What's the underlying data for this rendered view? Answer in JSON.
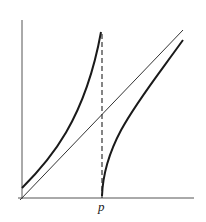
{
  "diagram": {
    "type": "function-graph",
    "labels": {
      "x_marker": "p"
    },
    "colors": {
      "axes": "#555555",
      "curves": "#1a1a1a",
      "diagonal": "#333333",
      "dashed": "#222222"
    },
    "elements": [
      "y-axis",
      "x-axis",
      "diagonal line y = x",
      "left curve increasing convex from near origin to vertical asymptote at p",
      "right curve increasing concave starting at p on x-axis",
      "dashed vertical line at x = p"
    ]
  }
}
